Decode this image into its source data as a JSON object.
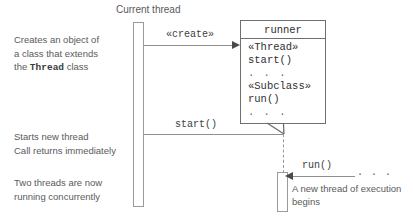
{
  "diagram": {
    "colors": {
      "background": "#ffffff",
      "line": "#8f8f8f",
      "box_border": "#6f6f6f",
      "note_text": "#5a5a5a",
      "code_text": "#2f2f2f",
      "arrowhead": "#4a4a4a"
    }
  },
  "lifelines": {
    "current_thread": {
      "label": "Current thread"
    },
    "new_thread": {
      "label": ""
    }
  },
  "object_box": {
    "name": "runner",
    "compartments": [
      "«Thread»",
      "start()",
      ". . .",
      "«Subclass»",
      "run()",
      ". . ."
    ]
  },
  "messages": {
    "create": {
      "label": "«create»"
    },
    "start": {
      "label": "start()"
    },
    "run": {
      "label": "run()",
      "trailing_dots": ". . ."
    }
  },
  "notes": {
    "create_note": {
      "line1": "Creates an object of",
      "line2": "a class that extends",
      "line3_prefix": "the ",
      "line3_code": "Thread",
      "line3_suffix": " class"
    },
    "start_note": {
      "line1": "Starts new thread",
      "line2": "Call returns immediately"
    },
    "concurrent_note": {
      "line1": "Two threads are now",
      "line2": "running concurrently"
    },
    "new_thread_note": {
      "line1": "A new thread of execution",
      "line2": "begins"
    }
  }
}
